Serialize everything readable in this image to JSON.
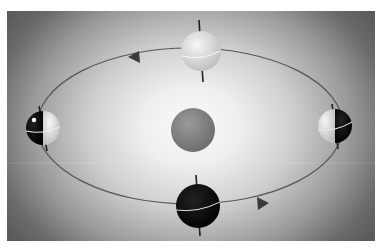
{
  "diagram": {
    "colors": {
      "background_outer": "#5a5a5a",
      "background_center": "#fbfbfb",
      "orbit": "#555555",
      "sun": "#8a8a8a",
      "earth_dark": "#0a0a0a",
      "earth_light": "#e6e6e6"
    },
    "sun": {
      "label": "Sun"
    },
    "orbit": {
      "direction": "counter-clockwise",
      "arrows": 2
    },
    "earth_positions": [
      {
        "id": "top",
        "label": "Earth - far side, fully lit"
      },
      {
        "id": "left",
        "label": "Earth - left, half lit (dark left side)"
      },
      {
        "id": "right",
        "label": "Earth - right, half lit (dark right side)"
      },
      {
        "id": "bottom",
        "label": "Earth - near side, fully dark"
      }
    ]
  }
}
